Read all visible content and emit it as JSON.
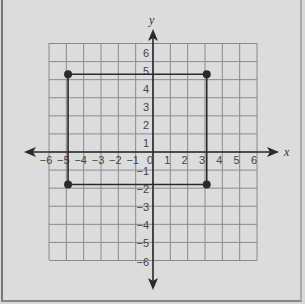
{
  "figure": {
    "background": "#dcdcdc",
    "grid_color": "#8a8a8a",
    "axis_color": "#2a2a2a",
    "shape_color": "#2a2a2a",
    "axes": {
      "x_label": "x",
      "y_label": "y",
      "x_ticks": [
        "−6",
        "−5",
        "−4",
        "−3",
        "−2",
        "−1",
        "0",
        "1",
        "2",
        "3",
        "4",
        "5",
        "6"
      ],
      "y_ticks_pos": [
        "6",
        "5",
        "4",
        "3",
        "2",
        "1"
      ],
      "y_ticks_neg": [
        "−1",
        "−2",
        "−3",
        "−4",
        "−5",
        "−6"
      ]
    }
  },
  "chart_data": {
    "type": "scatter",
    "title": "",
    "xlabel": "x",
    "ylabel": "y",
    "xlim": [
      -6,
      6
    ],
    "ylim": [
      -6,
      6
    ],
    "grid": true,
    "points": [
      {
        "x": -4.9,
        "y": 4.3
      },
      {
        "x": 3.1,
        "y": 4.3
      },
      {
        "x": 3.1,
        "y": -1.8
      },
      {
        "x": -4.9,
        "y": -1.8
      }
    ],
    "shapes": [
      {
        "type": "rectangle",
        "vertices": [
          [
            -4.9,
            4.3
          ],
          [
            3.1,
            4.3
          ],
          [
            3.1,
            -1.8
          ],
          [
            -4.9,
            -1.8
          ]
        ]
      }
    ]
  }
}
